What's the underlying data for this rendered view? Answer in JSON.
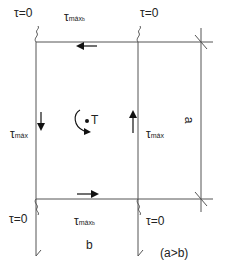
{
  "diagram": {
    "labels": {
      "tau_zero_top_left": "τ=0",
      "tau_zero_top_right": "τ=0",
      "tau_zero_bottom_left": "τ=0",
      "tau_zero_bottom_right": "τ=0",
      "tau_max_b_top": {
        "base": "τ",
        "sub": "máx",
        "subsub": "b"
      },
      "tau_max_b_bottom": {
        "base": "τ",
        "sub": "máx",
        "subsub": "b"
      },
      "tau_max_left": {
        "base": "τ",
        "sub": "máx"
      },
      "tau_max_right": {
        "base": "τ",
        "sub": "máx"
      },
      "torque": "T",
      "dimension_a": "a",
      "dimension_b": "b",
      "condition": "(a>b)"
    },
    "colors": {
      "line": "#555555",
      "text": "#222222",
      "background": "#ffffff"
    }
  }
}
